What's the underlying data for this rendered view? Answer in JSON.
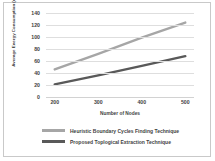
{
  "chart_data": {
    "type": "line",
    "title": "",
    "xlabel": "Number of Nodes",
    "ylabel": "Average Energy Consumption (mJ)",
    "x": [
      200,
      300,
      400,
      500
    ],
    "xlim": [
      180,
      520
    ],
    "ylim": [
      0,
      140
    ],
    "ytick_labels": [
      "0",
      "20",
      "40",
      "60",
      "80",
      "100",
      "120",
      "140"
    ],
    "ytick_values": [
      0,
      20,
      40,
      60,
      80,
      100,
      120,
      140
    ],
    "xtick_labels": [
      "200",
      "300",
      "400",
      "500"
    ],
    "grid": "horizontal",
    "legend_position": "bottom",
    "series": [
      {
        "name": "Heuristic Boundary Cycles Finding Technique",
        "color": "#a6a6a6",
        "values": [
          46,
          72,
          99,
          124
        ]
      },
      {
        "name": "Proposed Toplogical Extraction Technique",
        "color": "#595959",
        "values": [
          21,
          36,
          52,
          68
        ]
      }
    ]
  },
  "colors": {
    "frame_border": "#c9c9c9",
    "gridline": "#dedede",
    "text": "#3f3f3f",
    "background": "#ffffff"
  }
}
